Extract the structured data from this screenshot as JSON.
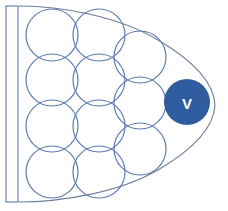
{
  "figure": {
    "canvas": {
      "width": 228,
      "height": 211,
      "background": "#ffffff"
    },
    "colors": {
      "outline_stroke": "#6b7d99",
      "circle_stroke": "#5c7cb3",
      "circle_fill": "none",
      "marker_fill": "#2f5c9e",
      "marker_text": "#ffffff",
      "bar_stroke": "#5c7cb3",
      "bar_fill": "#ffffff"
    },
    "outer_shape": {
      "name": "ogive-outline",
      "path": "M 20 6 L 70 9 L 120 20 L 160 36 L 192 60 L 211 88 L 215 106 L 210 126 L 192 150 L 160 172 L 118 188 L 70 198 L 20 202 L 20 6 Z",
      "stroke_width": 1.1
    },
    "left_bar": {
      "name": "left-edge-bar",
      "x": 6,
      "y": 6,
      "width": 12,
      "height": 196,
      "stroke_width": 1.1
    },
    "circles": [
      {
        "id": "c-r1-a",
        "cx": 52,
        "cy": 35,
        "r": 26
      },
      {
        "id": "c-r1-b",
        "cx": 99,
        "cy": 35,
        "r": 26
      },
      {
        "id": "c-r2-a",
        "cx": 52,
        "cy": 80,
        "r": 26
      },
      {
        "id": "c-r2-b",
        "cx": 99,
        "cy": 80,
        "r": 26
      },
      {
        "id": "c-r2-c",
        "cx": 140,
        "cy": 57,
        "r": 26
      },
      {
        "id": "c-r3-a",
        "cx": 52,
        "cy": 126,
        "r": 26
      },
      {
        "id": "c-r3-b",
        "cx": 99,
        "cy": 126,
        "r": 26
      },
      {
        "id": "c-r3-c",
        "cx": 140,
        "cy": 103,
        "r": 26
      },
      {
        "id": "c-r4-a",
        "cx": 52,
        "cy": 172,
        "r": 26
      },
      {
        "id": "c-r4-b",
        "cx": 99,
        "cy": 172,
        "r": 26
      },
      {
        "id": "c-r4-c",
        "cx": 140,
        "cy": 149,
        "r": 26
      },
      {
        "id": "c-r1-c",
        "cx": 176,
        "cy": 0,
        "r": 0
      }
    ],
    "marker": {
      "id": "marker-v",
      "label": "V",
      "cx": 187,
      "cy": 102,
      "r": 23
    }
  }
}
